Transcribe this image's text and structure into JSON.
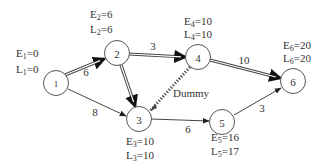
{
  "diagram": {
    "type": "activity-on-arrow network",
    "nodes": [
      {
        "id": "1",
        "label": "1",
        "E": "E₁=0",
        "L": "L₁=0",
        "x": 56,
        "y": 83
      },
      {
        "id": "2",
        "label": "2",
        "E": "E₂=6",
        "L": "L₂=6",
        "x": 117,
        "y": 53
      },
      {
        "id": "3",
        "label": "3",
        "E": "E₃=10",
        "L": "L₃=10",
        "x": 139,
        "y": 119
      },
      {
        "id": "4",
        "label": "4",
        "E": "E₄=10",
        "L": "L₄=10",
        "x": 198,
        "y": 57
      },
      {
        "id": "5",
        "label": "5",
        "E": "E₅=16",
        "L": "L₅=17",
        "x": 222,
        "y": 122
      },
      {
        "id": "6",
        "label": "6",
        "E": "E₆=20",
        "L": "L₆=20",
        "x": 293,
        "y": 81
      }
    ],
    "edges": [
      {
        "from": "1",
        "to": "2",
        "weight": "6",
        "critical": true
      },
      {
        "from": "1",
        "to": "3",
        "weight": "8",
        "critical": false
      },
      {
        "from": "2",
        "to": "3",
        "weight": "",
        "critical": true
      },
      {
        "from": "2",
        "to": "4",
        "weight": "3",
        "critical": true
      },
      {
        "from": "3",
        "to": "4",
        "weight": "",
        "label": "Dummy",
        "critical": false,
        "dummy": true
      },
      {
        "from": "3",
        "to": "5",
        "weight": "6",
        "critical": false
      },
      {
        "from": "4",
        "to": "6",
        "weight": "10",
        "critical": true
      },
      {
        "from": "5",
        "to": "6",
        "weight": "3",
        "critical": false
      }
    ],
    "dummy_label": "Dummy",
    "edge_weights": {
      "e12": "6",
      "e13": "8",
      "e24": "3",
      "e35": "6",
      "e46": "10",
      "e56": "3"
    },
    "node_labels": {
      "n1": "1",
      "n2": "2",
      "n3": "3",
      "n4": "4",
      "n5": "5",
      "n6": "6"
    },
    "annotations": {
      "n1": {
        "E": "E",
        "Esub": "1",
        "Eval": "=0",
        "L": "L",
        "Lsub": "1",
        "Lval": "=0"
      },
      "n2": {
        "E": "E",
        "Esub": "2",
        "Eval": "=6",
        "L": "L",
        "Lsub": "2",
        "Lval": "=6"
      },
      "n3": {
        "E": "E",
        "Esub": "3",
        "Eval": "=10",
        "L": "L",
        "Lsub": "3",
        "Lval": "=10"
      },
      "n4": {
        "E": "E",
        "Esub": "4",
        "Eval": "=10",
        "L": "L",
        "Lsub": "4",
        "Lval": "=10"
      },
      "n5": {
        "E": "E",
        "Esub": "5",
        "Eval": "=16",
        "L": "L",
        "Lsub": "5",
        "Lval": "=17"
      },
      "n6": {
        "E": "E",
        "Esub": "6",
        "Eval": "=20",
        "L": "L",
        "Lsub": "6",
        "Lval": "=20"
      }
    },
    "colors": {
      "stroke": "#444444",
      "text": "#333333",
      "background": "#ffffff"
    }
  }
}
